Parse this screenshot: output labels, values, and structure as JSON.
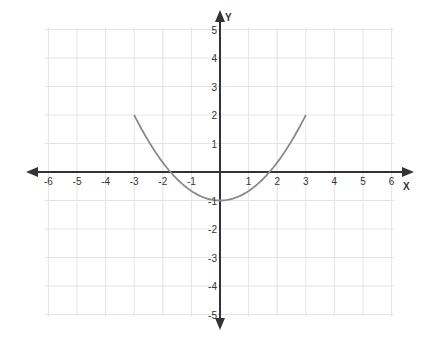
{
  "chart_data": {
    "type": "line",
    "title": "",
    "xlabel": "X",
    "ylabel": "Y",
    "xlim": [
      -6,
      6
    ],
    "ylim": [
      -5,
      5
    ],
    "grid": true,
    "x_ticks": [
      -6,
      -5,
      -4,
      -3,
      -2,
      -1,
      1,
      2,
      3,
      4,
      5,
      6
    ],
    "y_ticks": [
      -5,
      -4,
      -3,
      -2,
      -1,
      1,
      2,
      3,
      4,
      5
    ],
    "series": [
      {
        "name": "parabola",
        "equation": "y = x^2/3 - 1",
        "x": [
          -3,
          -2.5,
          -2,
          -1.5,
          -1,
          -0.5,
          0,
          0.5,
          1,
          1.5,
          2,
          2.5,
          3
        ],
        "y": [
          2,
          1.08,
          0.33,
          -0.25,
          -0.67,
          -0.92,
          -1,
          -0.92,
          -0.67,
          -0.25,
          0.33,
          1.08,
          2
        ],
        "color": "#8a8a8a"
      }
    ]
  },
  "colors": {
    "axis": "#333333",
    "grid": "#e4e4e4",
    "curve": "#8a8a8a"
  }
}
